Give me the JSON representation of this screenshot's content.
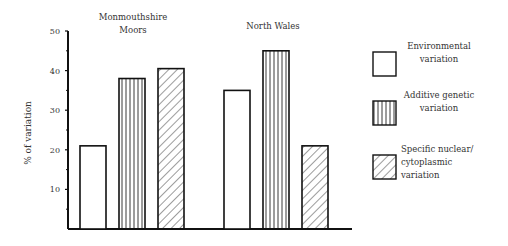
{
  "chart_data": {
    "type": "bar",
    "title": "",
    "xlabel": "",
    "ylabel": "% of variation",
    "ylim": [
      0,
      50
    ],
    "yticks": [
      10,
      20,
      30,
      40,
      50
    ],
    "grid": false,
    "legend_position": "right",
    "categories": [
      "Monmouthshire Moors",
      "North Wales"
    ],
    "series": [
      {
        "name": "Environmental variation",
        "pattern": "none",
        "values": [
          21,
          35
        ]
      },
      {
        "name": "Additive genetic variation",
        "pattern": "vertical-lines",
        "values": [
          38,
          45
        ]
      },
      {
        "name": "Specific nuclear/ cytoplasmic variation",
        "pattern": "diagonal-hatch",
        "values": [
          40.5,
          21
        ]
      }
    ]
  },
  "labels": {
    "group1_line1": "Monmouthshire",
    "group1_line2": "Moors",
    "group2": "North Wales",
    "ylabel": "% of variation",
    "legend": [
      [
        "Environmental",
        "variation"
      ],
      [
        "Additive genetic",
        "variation"
      ],
      [
        "Specific nuclear/",
        "cytoplasmic",
        "variation"
      ]
    ],
    "ticks": [
      "10",
      "20",
      "30",
      "40",
      "50"
    ]
  }
}
